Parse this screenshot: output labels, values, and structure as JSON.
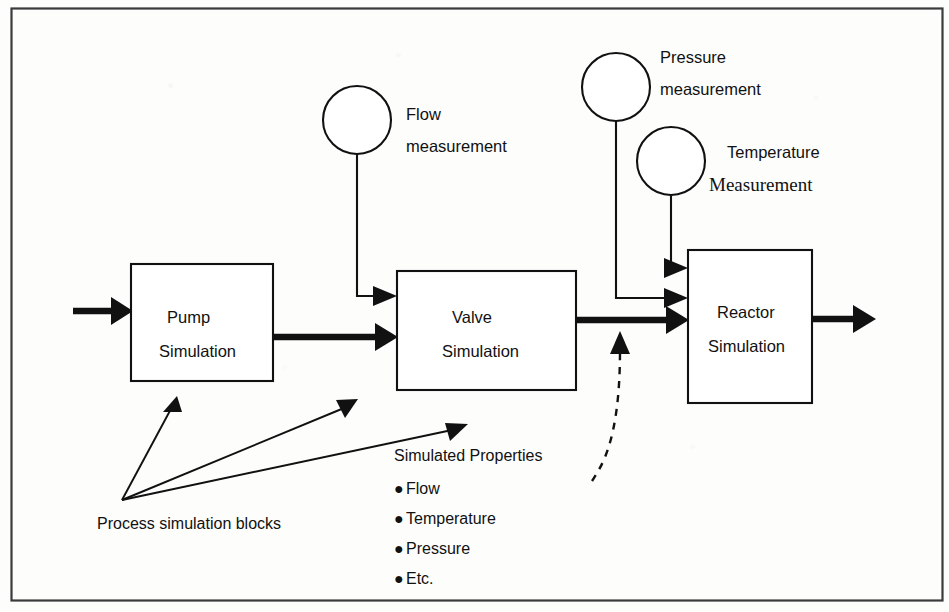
{
  "diagram": {
    "frame": {
      "color": "#3b3b3b"
    },
    "blocks": [
      {
        "id": "pump",
        "line1": "Pump",
        "line2": "Simulation"
      },
      {
        "id": "valve",
        "line1": "Valve",
        "line2": "Simulation"
      },
      {
        "id": "reactor",
        "line1": "Reactor",
        "line2": "Simulation"
      }
    ],
    "measurements": [
      {
        "id": "flow",
        "line1": "Flow",
        "line2": "measurement"
      },
      {
        "id": "pressure",
        "line1": "Pressure",
        "line2": "measurement"
      },
      {
        "id": "temperature",
        "line1": "Temperature",
        "line2": "Measurement"
      }
    ],
    "legend": {
      "blocks_caption": "Process  simulation  blocks",
      "properties_heading": "Simulated  Properties",
      "properties": [
        "Flow",
        "Temperature",
        "Pressure",
        "Etc."
      ],
      "bullet_glyph": "●"
    },
    "colors": {
      "ink": "#111111",
      "frame": "#3b3b3b",
      "paper": "#fdfdfc"
    }
  }
}
